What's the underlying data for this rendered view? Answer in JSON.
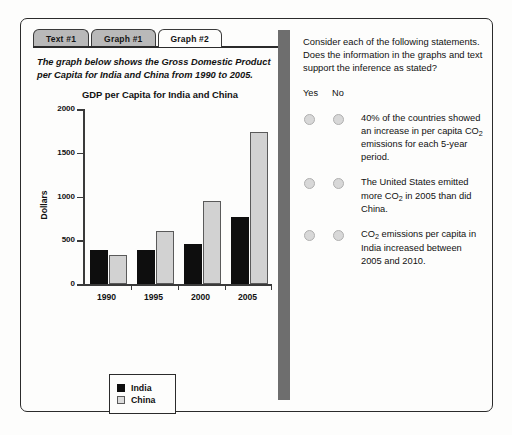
{
  "tabs": [
    {
      "label": "Text #1",
      "active": false
    },
    {
      "label": "Graph #1",
      "active": false
    },
    {
      "label": "Graph #2",
      "active": true
    }
  ],
  "left_panel": {
    "intro": "The graph below shows the Gross Domestic Product per Capita for India and China from 1990 to 2005."
  },
  "chart_data": {
    "type": "bar",
    "title": "GDP per Capita for India and China",
    "xlabel": "",
    "ylabel": "Dollars",
    "categories": [
      "1990",
      "1995",
      "2000",
      "2005"
    ],
    "ylim": [
      0,
      2000
    ],
    "yticks": [
      0,
      500,
      1000,
      1500,
      2000
    ],
    "ytick_labels": [
      "0",
      "500",
      "1000",
      "1500",
      "2000"
    ],
    "grid": false,
    "legend_position": "below-left",
    "series": [
      {
        "name": "India",
        "color": "#0e0e0e",
        "values": [
          390,
          390,
          460,
          770
        ]
      },
      {
        "name": "China",
        "color": "#d2d2d2",
        "values": [
          330,
          610,
          950,
          1740
        ]
      }
    ]
  },
  "right_panel": {
    "prompt": "Consider each of the following statements. Does the information in the graphs and text support the inference as stated?",
    "yes_label": "Yes",
    "no_label": "No",
    "statements": [
      {
        "parts": [
          "40% of the countries showed an increase in per capita CO",
          "2",
          " emissions for each 5-year period."
        ]
      },
      {
        "parts": [
          "The United States emitted more CO",
          "2",
          " in 2005 than did China."
        ]
      },
      {
        "parts": [
          "CO",
          "2",
          " emissions per capita in India increased between 2005 and 2010."
        ]
      }
    ]
  }
}
